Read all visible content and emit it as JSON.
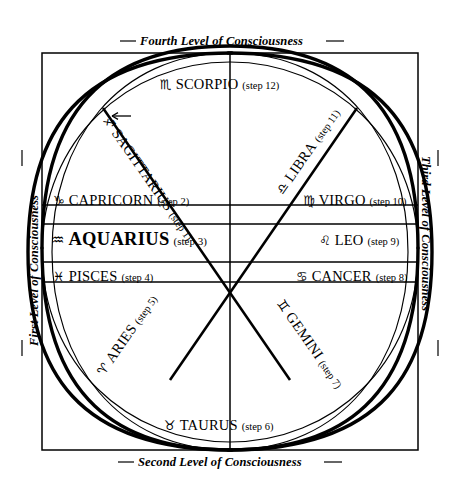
{
  "diagram": {
    "ink_color": "#000000",
    "background": "#ffffff"
  },
  "levels": [
    {
      "id": "first",
      "label": "First Level of Consciousness",
      "position": "left",
      "orientation": "bottom-to-top"
    },
    {
      "id": "second",
      "label": "Second Level of Consciousness",
      "position": "bottom",
      "orientation": "horizontal"
    },
    {
      "id": "third",
      "label": "Third Level of Consciousness",
      "position": "right",
      "orientation": "top-to-bottom"
    },
    {
      "id": "fourth",
      "label": "Fourth Level of Consciousness",
      "position": "top",
      "orientation": "horizontal"
    }
  ],
  "signs": [
    {
      "key": "sagittarius",
      "glyph": "♐",
      "name": "SAGITTARIUS",
      "step": "(step 1)",
      "step_number": 1,
      "placement": "diagonal-upper-left"
    },
    {
      "key": "capricorn",
      "glyph": "♑",
      "name": "CAPRICORN",
      "step": "(step 2)",
      "step_number": 2,
      "placement": "left-upper"
    },
    {
      "key": "aquarius",
      "glyph": "♒",
      "name": "AQUARIUS",
      "step": "(step 3)",
      "step_number": 3,
      "placement": "left-middle",
      "emphasis": "bold-large"
    },
    {
      "key": "pisces",
      "glyph": "♓",
      "name": "PISCES",
      "step": "(step 4)",
      "step_number": 4,
      "placement": "left-lower"
    },
    {
      "key": "aries",
      "glyph": "♈",
      "name": "ARIES",
      "step": "(step 5)",
      "step_number": 5,
      "placement": "diagonal-lower-left"
    },
    {
      "key": "taurus",
      "glyph": "♉",
      "name": "TAURUS",
      "step": "(step 6)",
      "step_number": 6,
      "placement": "bottom-center"
    },
    {
      "key": "gemini",
      "glyph": "♊",
      "name": "GEMINI",
      "step": "(step 7)",
      "step_number": 7,
      "placement": "diagonal-lower-right"
    },
    {
      "key": "cancer",
      "glyph": "♋",
      "name": "CANCER",
      "step": "(step 8)",
      "step_number": 8,
      "placement": "right-lower"
    },
    {
      "key": "leo",
      "glyph": "♌",
      "name": "LEO",
      "step": "(step 9)",
      "step_number": 9,
      "placement": "right-middle"
    },
    {
      "key": "virgo",
      "glyph": "♍",
      "name": "VIRGO",
      "step": "(step 10)",
      "step_number": 10,
      "placement": "right-upper"
    },
    {
      "key": "libra",
      "glyph": "♎",
      "name": "LIBRA",
      "step": "(step 11)",
      "step_number": 11,
      "placement": "diagonal-upper-right"
    },
    {
      "key": "scorpio",
      "glyph": "♏",
      "name": "SCORPIO",
      "step": "(step 12)",
      "step_number": 12,
      "placement": "top-center"
    }
  ],
  "direction_marker": {
    "name": "counterclockwise-arrow",
    "symbol": "←"
  }
}
